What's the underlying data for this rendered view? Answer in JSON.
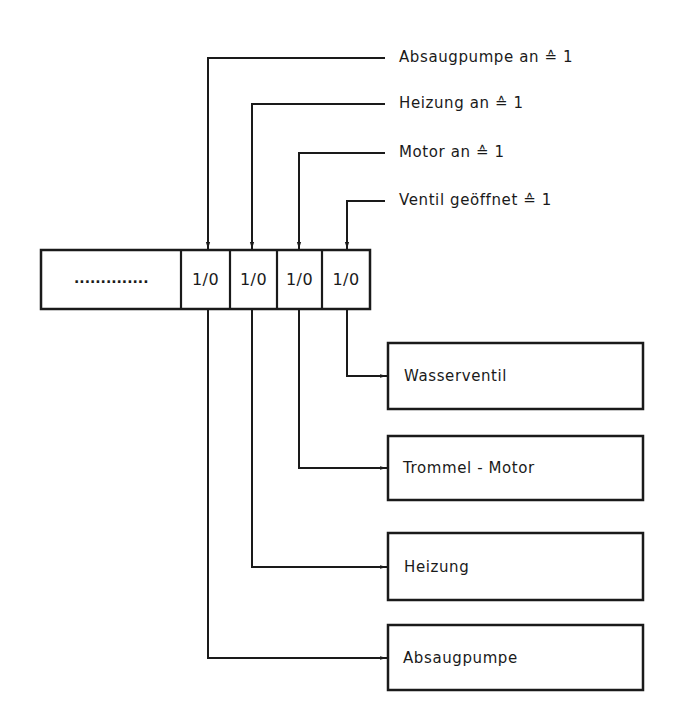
{
  "diagram": {
    "register": {
      "placeholder": "..............",
      "bits": [
        {
          "value": "1/0",
          "controls": "Absaugpumpe"
        },
        {
          "value": "1/0",
          "controls": "Heizung"
        },
        {
          "value": "1/0",
          "controls": "Trommel-Motor"
        },
        {
          "value": "1/0",
          "controls": "Wasserventil"
        }
      ]
    },
    "inputs": [
      {
        "text": "Absaugpumpe an ≙ 1"
      },
      {
        "text": "Heizung an ≙ 1"
      },
      {
        "text": "Motor an  ≙ 1"
      },
      {
        "text": "Ventil geöffnet  ≙ 1"
      }
    ],
    "outputs": [
      {
        "label": "Wasserventil"
      },
      {
        "label": "Trommel - Motor"
      },
      {
        "label": "Heizung"
      },
      {
        "label": "Absaugpumpe"
      }
    ],
    "colors": {
      "line": "#1a1a1a",
      "background": "#ffffff"
    }
  }
}
